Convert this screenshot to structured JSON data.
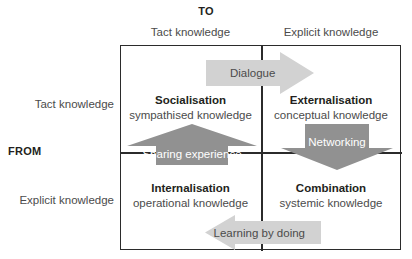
{
  "diagram": {
    "axes": {
      "to_label": "TO",
      "from_label": "FROM",
      "columns": [
        "Tact knowledge",
        "Explicit knowledge"
      ],
      "rows": [
        "Tact knowledge",
        "Explicit knowledge"
      ]
    },
    "quadrants": [
      {
        "key": "socialisation",
        "title": "Socialisation",
        "subtitle": "sympathised knowledge"
      },
      {
        "key": "externalisation",
        "title": "Externalisation",
        "subtitle": "conceptual knowledge"
      },
      {
        "key": "internalisation",
        "title": "Internalisation",
        "subtitle": "operational knowledge"
      },
      {
        "key": "combination",
        "title": "Combination",
        "subtitle": "systemic knowledge"
      }
    ],
    "arrows": [
      {
        "key": "dialogue",
        "label": "Dialogue",
        "direction": "right",
        "style": "light"
      },
      {
        "key": "sharing",
        "label": "Sharing experience",
        "direction": "up",
        "style": "dark"
      },
      {
        "key": "networking",
        "label": "Networking",
        "direction": "down",
        "style": "dark"
      },
      {
        "key": "learning",
        "label": "Learning by doing",
        "direction": "left",
        "style": "light"
      }
    ]
  },
  "colors": {
    "arrow_light": "#d2d2d2",
    "arrow_dark": "#919191",
    "border": "#2b2b2b",
    "text": "#4b4b4b",
    "text_bold": "#231f20",
    "background": "#ffffff"
  }
}
